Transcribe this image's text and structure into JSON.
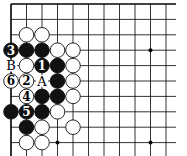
{
  "diagram": {
    "type": "go-board-fragment",
    "grid": {
      "origin_x": 11,
      "origin_y": 4,
      "spacing_x": 15.5,
      "spacing_y": 15.4,
      "cols": 11,
      "rows": 10,
      "right_edge_x": 176,
      "bottom_edge_y": 156,
      "line_color": "#000000",
      "top_edge_bold": true,
      "left_edge_bold": true
    },
    "star_points": [
      {
        "col": 3,
        "row": 9
      },
      {
        "col": 9,
        "row": 3
      },
      {
        "col": 9,
        "row": 9
      }
    ],
    "stones": [
      {
        "col": 1,
        "row": 2,
        "color": "white",
        "label": ""
      },
      {
        "col": 2,
        "row": 2,
        "color": "white",
        "label": ""
      },
      {
        "col": 0,
        "row": 3,
        "color": "black",
        "label": "3"
      },
      {
        "col": 1,
        "row": 3,
        "color": "black",
        "label": ""
      },
      {
        "col": 2,
        "row": 3,
        "color": "black",
        "label": ""
      },
      {
        "col": 3,
        "row": 3,
        "color": "white",
        "label": ""
      },
      {
        "col": 4,
        "row": 3,
        "color": "white",
        "label": ""
      },
      {
        "col": 1,
        "row": 4,
        "color": "white",
        "label": ""
      },
      {
        "col": 2,
        "row": 4,
        "color": "black",
        "label": "1"
      },
      {
        "col": 3,
        "row": 4,
        "color": "black",
        "label": ""
      },
      {
        "col": 4,
        "row": 4,
        "color": "white",
        "label": ""
      },
      {
        "col": 0,
        "row": 5,
        "color": "white",
        "label": "6"
      },
      {
        "col": 1,
        "row": 5,
        "color": "white",
        "label": "2"
      },
      {
        "col": 3,
        "row": 5,
        "color": "black",
        "label": ""
      },
      {
        "col": 4,
        "row": 5,
        "color": "white",
        "label": ""
      },
      {
        "col": 1,
        "row": 6,
        "color": "white",
        "label": "4"
      },
      {
        "col": 2,
        "row": 6,
        "color": "black",
        "label": ""
      },
      {
        "col": 3,
        "row": 6,
        "color": "black",
        "label": ""
      },
      {
        "col": 4,
        "row": 6,
        "color": "white",
        "label": ""
      },
      {
        "col": 0,
        "row": 7,
        "color": "black",
        "label": ""
      },
      {
        "col": 1,
        "row": 7,
        "color": "black",
        "label": "5"
      },
      {
        "col": 2,
        "row": 7,
        "color": "black",
        "label": ""
      },
      {
        "col": 3,
        "row": 7,
        "color": "white",
        "label": ""
      },
      {
        "col": 1,
        "row": 8,
        "color": "black",
        "label": ""
      },
      {
        "col": 2,
        "row": 8,
        "color": "white",
        "label": ""
      },
      {
        "col": 4,
        "row": 8,
        "color": "white",
        "label": ""
      },
      {
        "col": 1,
        "row": 9,
        "color": "white",
        "label": ""
      },
      {
        "col": 2,
        "row": 9,
        "color": "white",
        "label": ""
      }
    ],
    "point_labels": [
      {
        "col": 0,
        "row": 4,
        "text": "B"
      },
      {
        "col": 2,
        "row": 5,
        "text": "A"
      }
    ],
    "colors": {
      "black_stone": "#111111",
      "white_stone": "#ffffff",
      "stone_outline": "#111111",
      "background": "#ffffff"
    }
  }
}
